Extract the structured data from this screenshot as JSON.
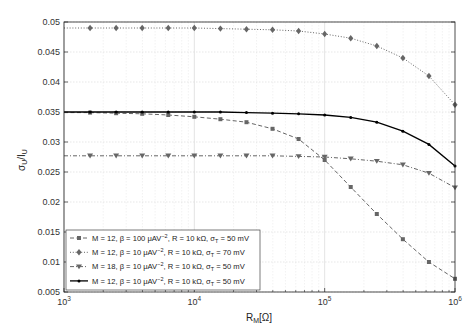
{
  "chart_data": {
    "type": "line",
    "title": "",
    "xlabel": "R_M[Ω]",
    "ylabel": "σ_U/I_U",
    "xscale": "log",
    "xlim": [
      1000,
      1000000
    ],
    "ylim": [
      0.005,
      0.05
    ],
    "grid": true,
    "legend_position": "lower left",
    "x_ticks": [
      "10^3",
      "10^4",
      "10^5",
      "10^6"
    ],
    "y_ticks": [
      "0.005",
      "0.01",
      "0.015",
      "0.02",
      "0.025",
      "0.03",
      "0.035",
      "0.04",
      "0.045",
      "0.05"
    ],
    "x": [
      1585,
      2512,
      3981,
      6310,
      10000,
      15849,
      25119,
      39811,
      63096,
      100000,
      158489,
      251189,
      398107,
      630957,
      1000000
    ],
    "series": [
      {
        "name": "M = 12, β = 100 μAV⁻², R = 10 kΩ, σ_T = 50 mV",
        "style": "dashed",
        "marker": "square",
        "color": "#666666",
        "values": [
          0.0349,
          0.0348,
          0.0347,
          0.0345,
          0.0342,
          0.0338,
          0.0333,
          0.0322,
          0.0305,
          0.027,
          0.0225,
          0.018,
          0.0138,
          0.01,
          0.0072
        ]
      },
      {
        "name": "M = 12, β = 10 μAV⁻², R = 10 kΩ, σ_T = 70 mV",
        "style": "dotted",
        "marker": "diamond",
        "color": "#666666",
        "values": [
          0.049,
          0.049,
          0.049,
          0.049,
          0.049,
          0.0489,
          0.0488,
          0.0487,
          0.0485,
          0.048,
          0.0473,
          0.046,
          0.044,
          0.041,
          0.0362
        ]
      },
      {
        "name": "M = 18, β = 10 μAV⁻², R = 10 kΩ, σ_T = 50 mV",
        "style": "dash-dot",
        "marker": "triangle-down",
        "color": "#666666",
        "values": [
          0.0277,
          0.0277,
          0.0277,
          0.0277,
          0.0277,
          0.0277,
          0.0277,
          0.0277,
          0.0276,
          0.0275,
          0.0272,
          0.0268,
          0.0262,
          0.0248,
          0.0224
        ]
      },
      {
        "name": "M = 12, β = 10 μAV⁻², R = 10 kΩ, σ_T = 50 mV",
        "style": "solid",
        "marker": "dot",
        "color": "#000000",
        "values": [
          0.035,
          0.035,
          0.035,
          0.035,
          0.035,
          0.035,
          0.0349,
          0.0348,
          0.0347,
          0.0345,
          0.0341,
          0.0333,
          0.0318,
          0.0296,
          0.026
        ]
      }
    ]
  },
  "legend": {
    "items": [
      {
        "pre": "M = 12, β = 100 μAV",
        "sup": "−2",
        "mid": ", R = 10 kΩ, σ",
        "sub": "T",
        "post": " = 50 mV"
      },
      {
        "pre": "M = 12, β = 10 μAV",
        "sup": "−2",
        "mid": ", R = 10 kΩ, σ",
        "sub": "T",
        "post": " = 70 mV"
      },
      {
        "pre": "M = 18, β = 10 μAV",
        "sup": "−2",
        "mid": ", R = 10 kΩ, σ",
        "sub": "T",
        "post": " = 50 mV"
      },
      {
        "pre": "M = 12, β = 10 μAV",
        "sup": "−2",
        "mid": ", R = 10 kΩ, σ",
        "sub": "T",
        "post": " = 50 mV"
      }
    ]
  },
  "axes": {
    "xlabel_main": "R",
    "xlabel_sub": "M",
    "xlabel_post": "[Ω]",
    "ylabel_a": "σ",
    "ylabel_a_sub": "U",
    "ylabel_b": "/I",
    "ylabel_b_sub": "U"
  }
}
